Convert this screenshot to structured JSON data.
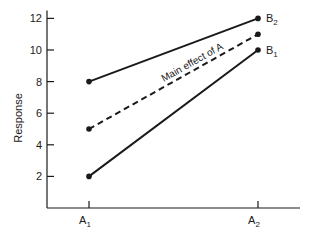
{
  "chart_data": {
    "type": "line",
    "title": "",
    "xlabel": "",
    "ylabel": "Response",
    "categories": [
      "A1",
      "A2"
    ],
    "category_labels": [
      {
        "base": "A",
        "sub": "1"
      },
      {
        "base": "A",
        "sub": "2"
      }
    ],
    "ylim": [
      0,
      12.5
    ],
    "yticks": [
      2,
      4,
      6,
      8,
      10,
      12
    ],
    "grid": false,
    "series": [
      {
        "name": "B2",
        "label_base": "B",
        "label_sub": "2",
        "values": [
          8,
          12
        ],
        "style": "solid"
      },
      {
        "name": "Main effect of A",
        "values": [
          5,
          11
        ],
        "style": "dashed"
      },
      {
        "name": "B1",
        "label_base": "B",
        "label_sub": "1",
        "values": [
          2,
          10
        ],
        "style": "solid"
      }
    ],
    "annotations": [
      {
        "text": "Main effect of A",
        "attached_to": "Main effect of A"
      }
    ],
    "colors": {
      "ink": "#1a1a1a"
    }
  }
}
